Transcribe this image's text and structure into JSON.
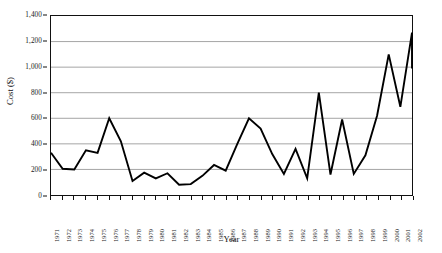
{
  "chart_data": {
    "type": "line",
    "title": "",
    "xlabel": "Year",
    "ylabel": "Cost ($)",
    "xlim": [
      1971,
      2002
    ],
    "ylim": [
      0,
      1400
    ],
    "grid": true,
    "grid_axis": "y",
    "legend": false,
    "legend_position": "none",
    "line_color": "#000000",
    "y_ticks": [
      0,
      200,
      400,
      600,
      800,
      1000,
      1200,
      1400
    ],
    "y_tick_labels": [
      "0",
      "200",
      "400",
      "600",
      "800",
      "1,000",
      "1,200",
      "1,400"
    ],
    "categories": [
      "1971",
      "1972",
      "1973",
      "1974",
      "1975",
      "1976",
      "1977",
      "1978",
      "1979",
      "1980",
      "1981",
      "1982",
      "1983",
      "1984",
      "1985",
      "1986",
      "1987",
      "1988",
      "1989",
      "1990",
      "1991",
      "1992",
      "1993",
      "1994",
      "1995",
      "1996",
      "1997",
      "1998",
      "1999",
      "2000",
      "2001",
      "2002"
    ],
    "x": [
      1971,
      1972,
      1973,
      1974,
      1975,
      1976,
      1977,
      1978,
      1979,
      1980,
      1981,
      1982,
      1983,
      1984,
      1985,
      1986,
      1987,
      1988,
      1989,
      1990,
      1991,
      1992,
      1993,
      1994,
      1995,
      1996,
      1997,
      1998,
      1999,
      2000,
      2001,
      2002
    ],
    "values": [
      330,
      205,
      200,
      350,
      330,
      600,
      420,
      110,
      175,
      130,
      170,
      80,
      85,
      150,
      235,
      190,
      400,
      600,
      520,
      320,
      165,
      360,
      130,
      800,
      160,
      590,
      165,
      310,
      620,
      1100,
      690,
      1270
    ],
    "series": [
      {
        "name": "Cost",
        "values": [
          330,
          205,
          200,
          350,
          330,
          600,
          420,
          110,
          175,
          130,
          170,
          80,
          85,
          150,
          235,
          190,
          400,
          600,
          520,
          320,
          165,
          360,
          130,
          800,
          160,
          590,
          165,
          310,
          620,
          1100,
          690,
          1270
        ]
      }
    ],
    "final_value": 990
  }
}
